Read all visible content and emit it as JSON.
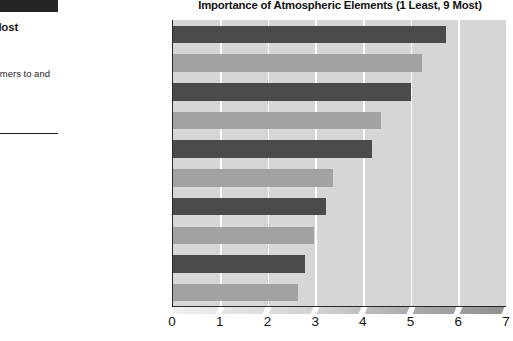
{
  "sidebar": {
    "black_bar": "",
    "heading": "ic\ne Most",
    "body": "ements\nmers to\nand buy-"
  },
  "chart_data": {
    "type": "bar",
    "orientation": "horizontal",
    "title": "Importance of Atmospheric Elements (1 Least, 9 Most)",
    "xlabel": "",
    "ylabel": "",
    "xlim": [
      0,
      7
    ],
    "xticks": [
      0,
      1,
      2,
      3,
      4,
      5,
      6,
      7
    ],
    "xtick_labels": [
      "0",
      "1",
      "2",
      "3",
      "4",
      "5",
      "6",
      "7"
    ],
    "grid": true,
    "grid_axis": "x",
    "grid_color": "#ffffff",
    "plot_background": "#d6d6d6",
    "legend": null,
    "categories": [
      "Lighting",
      "Signs",
      "Promotional events",
      "Fixtures",
      "Flooring",
      "Music",
      "Wall designs",
      "Audio announcements",
      "Video screens",
      "Mannequins"
    ],
    "values": [
      5.73,
      5.22,
      4.99,
      4.35,
      4.17,
      3.35,
      3.2,
      2.96,
      2.77,
      2.61
    ],
    "value_labels": [
      "5.73",
      "5.22",
      "4.99",
      "4.35",
      "4.17",
      "3.35",
      "3.20",
      "2.96",
      "2.77",
      "2.61"
    ],
    "bar_colors": [
      "dark",
      "light",
      "dark",
      "light",
      "dark",
      "light",
      "dark",
      "light",
      "dark",
      "light"
    ],
    "colors": {
      "dark": "#4b4b4b",
      "light": "#a2a2a2",
      "axis": "#2a2a2a",
      "text": "#1c1c1c"
    }
  }
}
